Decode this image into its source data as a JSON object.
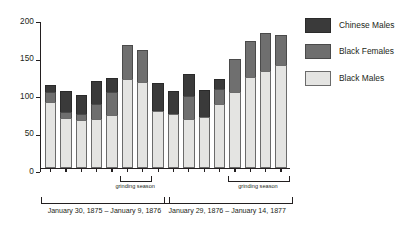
{
  "chart_data": {
    "type": "bar",
    "stacked": true,
    "title": "",
    "subtitle": "",
    "xlabel": "",
    "ylabel": "",
    "ylim": [
      0,
      200
    ],
    "yticks": [
      0,
      50,
      100,
      150,
      200
    ],
    "ytick_labels": [
      "0",
      "50",
      "100",
      "150",
      "200"
    ],
    "grid": false,
    "legend_position": "right",
    "categories": [
      "1",
      "2",
      "3",
      "4",
      "5",
      "6",
      "7",
      "8",
      "9",
      "10",
      "11",
      "12",
      "13",
      "14",
      "15",
      "16"
    ],
    "series": [
      {
        "name": "Black Males",
        "color": "#e4e4e2",
        "values": [
          88,
          67,
          64,
          66,
          71,
          119,
          115,
          76,
          72,
          65,
          68,
          85,
          102,
          122,
          130,
          138
        ]
      },
      {
        "name": "Black Females",
        "color": "#6f6f6f",
        "values": [
          14,
          8,
          8,
          19,
          30,
          45,
          43,
          0,
          0,
          31,
          0,
          20,
          44,
          47,
          50,
          39
        ]
      },
      {
        "name": "Chinese Males",
        "color": "#3a3a3a",
        "values": [
          9,
          28,
          26,
          31,
          19,
          0,
          0,
          37,
          31,
          30,
          36,
          14,
          0,
          0,
          0,
          0
        ]
      }
    ],
    "totals": [
      111,
      103,
      98,
      116,
      120,
      164,
      158,
      113,
      103,
      126,
      104,
      119,
      146,
      169,
      180,
      177
    ],
    "annotations": [
      {
        "text": "grinding season",
        "spans_bars": [
          6,
          7
        ]
      },
      {
        "text": "grinding season",
        "spans_bars": [
          13,
          16
        ]
      }
    ],
    "period_labels": [
      {
        "text": "January 30, 1875 – January 9, 1876",
        "spans_bars": [
          1,
          8
        ]
      },
      {
        "text": "January 29, 1876  –  January 14, 1877",
        "spans_bars": [
          9,
          16
        ]
      }
    ]
  },
  "legend": {
    "items": [
      {
        "label": "Chinese Males",
        "swatch": "dark-gray-swatch"
      },
      {
        "label": "Black Females",
        "swatch": "medium-gray-swatch"
      },
      {
        "label": "Black Males",
        "swatch": "light-gray-swatch"
      }
    ]
  },
  "axis": {
    "y_tick_labels": [
      "200",
      "150",
      "100",
      "50",
      "0"
    ]
  },
  "brackets": {
    "grinding_left": "grinding season",
    "grinding_right": "grinding season"
  },
  "periods": {
    "left": "January 30, 1875 – January 9, 1876",
    "right": "January 29, 1876  –  January 14, 1877"
  }
}
